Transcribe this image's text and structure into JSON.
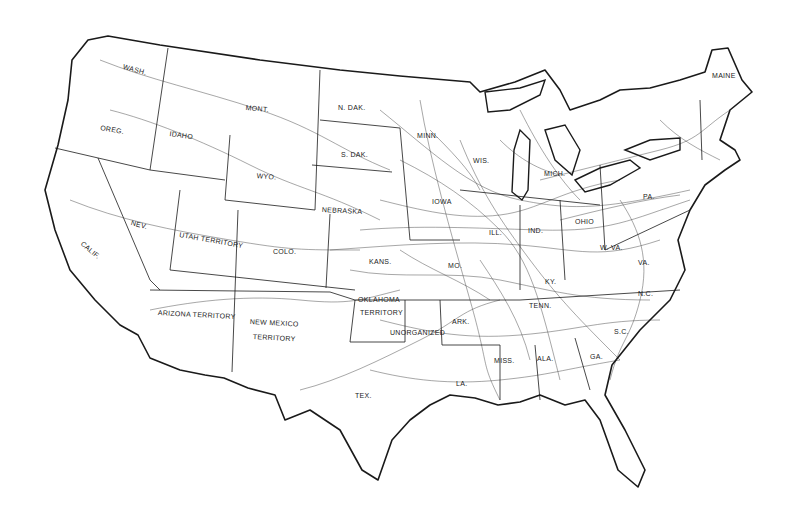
{
  "map": {
    "title": "United States railroad network map",
    "colors": {
      "background": "#ffffff",
      "ink": "#1a1a1a"
    },
    "labels": [
      {
        "id": "wash",
        "text": "WASH.",
        "x": 124,
        "y": 63,
        "rot": 15
      },
      {
        "id": "oreg",
        "text": "OREG.",
        "x": 101,
        "y": 124,
        "rot": 10
      },
      {
        "id": "idaho",
        "text": "IDAHO",
        "x": 170,
        "y": 130,
        "rot": 8
      },
      {
        "id": "mont",
        "text": "MONT.",
        "x": 246,
        "y": 104,
        "rot": 5
      },
      {
        "id": "wyo",
        "text": "WYO.",
        "x": 257,
        "y": 172,
        "rot": 5
      },
      {
        "id": "ndak",
        "text": "N. DAK.",
        "x": 338,
        "y": 104,
        "rot": 0
      },
      {
        "id": "sdak",
        "text": "S. DAK.",
        "x": 341,
        "y": 151,
        "rot": 0
      },
      {
        "id": "nebraska",
        "text": "NEBRASKA",
        "x": 322,
        "y": 206,
        "rot": 3
      },
      {
        "id": "minn",
        "text": "MINN.",
        "x": 417,
        "y": 132,
        "rot": 0
      },
      {
        "id": "nev",
        "text": "NEV.",
        "x": 132,
        "y": 219,
        "rot": 15
      },
      {
        "id": "calif",
        "text": "CALIF.",
        "x": 84,
        "y": 240,
        "rot": 40
      },
      {
        "id": "utah",
        "text": "UTAH TERRITORY",
        "x": 180,
        "y": 231,
        "rot": 10
      },
      {
        "id": "colo",
        "text": "COLO.",
        "x": 273,
        "y": 248,
        "rot": 0
      },
      {
        "id": "kans",
        "text": "KANS.",
        "x": 369,
        "y": 258,
        "rot": 0
      },
      {
        "id": "arizona",
        "text": "ARIZONA TERRITORY",
        "x": 158,
        "y": 309,
        "rot": 3
      },
      {
        "id": "newmexico1",
        "text": "NEW MEXICO",
        "x": 250,
        "y": 318,
        "rot": 3
      },
      {
        "id": "newmexico2",
        "text": "TERRITORY",
        "x": 253,
        "y": 333,
        "rot": 3
      },
      {
        "id": "oklahoma1",
        "text": "OKLAHOMA",
        "x": 358,
        "y": 296,
        "rot": 0
      },
      {
        "id": "oklahoma2",
        "text": "TERRITORY",
        "x": 360,
        "y": 309,
        "rot": 0
      },
      {
        "id": "unorganized",
        "text": "UNORGANIZED",
        "x": 390,
        "y": 329,
        "rot": 0
      },
      {
        "id": "ark",
        "text": "ARK.",
        "x": 452,
        "y": 318,
        "rot": 0
      },
      {
        "id": "tex",
        "text": "TEX.",
        "x": 355,
        "y": 392,
        "rot": 0
      },
      {
        "id": "la",
        "text": "LA.",
        "x": 456,
        "y": 380,
        "rot": 0
      },
      {
        "id": "miss",
        "text": "MISS.",
        "x": 494,
        "y": 357,
        "rot": 0
      },
      {
        "id": "ala",
        "text": "ALA.",
        "x": 537,
        "y": 355,
        "rot": 0
      },
      {
        "id": "ga",
        "text": "GA.",
        "x": 590,
        "y": 353,
        "rot": 0
      },
      {
        "id": "tenn",
        "text": "TENN.",
        "x": 529,
        "y": 302,
        "rot": 0
      },
      {
        "id": "ky",
        "text": "KY.",
        "x": 545,
        "y": 278,
        "rot": 0
      },
      {
        "id": "wva",
        "text": "W. VA.",
        "x": 600,
        "y": 244,
        "rot": 0
      },
      {
        "id": "nc",
        "text": "N.C.",
        "x": 638,
        "y": 290,
        "rot": 0
      },
      {
        "id": "sc",
        "text": "S.C.",
        "x": 614,
        "y": 328,
        "rot": 0
      },
      {
        "id": "va",
        "text": "VA.",
        "x": 638,
        "y": 259,
        "rot": 0
      },
      {
        "id": "iowa",
        "text": "IOWA",
        "x": 432,
        "y": 198,
        "rot": 0
      },
      {
        "id": "ill",
        "text": "ILL.",
        "x": 489,
        "y": 229,
        "rot": 0
      },
      {
        "id": "ind",
        "text": "IND.",
        "x": 528,
        "y": 227,
        "rot": 0
      },
      {
        "id": "ohio",
        "text": "OHIO",
        "x": 575,
        "y": 218,
        "rot": 0
      },
      {
        "id": "pa",
        "text": "PA.",
        "x": 643,
        "y": 193,
        "rot": 0
      },
      {
        "id": "mo",
        "text": "MO.",
        "x": 448,
        "y": 262,
        "rot": 0
      },
      {
        "id": "wis",
        "text": "WIS.",
        "x": 473,
        "y": 157,
        "rot": 0
      },
      {
        "id": "mich",
        "text": "MICH.",
        "x": 544,
        "y": 170,
        "rot": 0
      },
      {
        "id": "maine",
        "text": "MAINE",
        "x": 712,
        "y": 72,
        "rot": 0
      }
    ]
  }
}
